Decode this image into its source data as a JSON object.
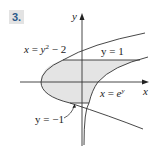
{
  "problem": {
    "number": "3."
  },
  "axes": {
    "x_label": "x",
    "y_label": "y"
  },
  "labels": {
    "parabola": {
      "lhs": "x",
      "eq": " = ",
      "base": "y",
      "exp": "2",
      "tail": " − 2"
    },
    "upper_line": {
      "text": "y = 1"
    },
    "exp_curve": {
      "lhs": "x",
      "eq": " = ",
      "base": "e",
      "exp": "y"
    },
    "lower_line": {
      "text": "y = −1"
    }
  },
  "colors": {
    "shade": "#e4e4e4",
    "stroke": "#333333",
    "badge_text": "#2b5a8a"
  },
  "region": {
    "description": "Region bounded by x = y^2 - 2 (left), x = e^y (right), y = 1 (top), y = -1 (bottom)",
    "bounds": [
      "x = y^2 - 2",
      "x = e^y",
      "y = 1",
      "y = -1"
    ]
  }
}
